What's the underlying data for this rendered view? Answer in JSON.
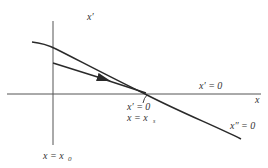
{
  "diagram": {
    "type": "phase-plane trajectory sketch",
    "colors": {
      "background": "#ffffff",
      "stroke": "#2a2a2a",
      "axis": "#555555",
      "text": "#333333"
    },
    "axes": {
      "vertical_label": "x′",
      "horizontal_label": "x"
    },
    "labels": {
      "xprime_zero_axis": "x′ = 0",
      "intersection_line1": "x′ = 0",
      "intersection_line2": "x = x",
      "intersection_sub": "s",
      "xdoubleprime_zero": "x″ = 0",
      "x0_main": "x = x",
      "x0_sub": "0"
    },
    "curves": [
      {
        "name": "x-double-prime-zero-curve",
        "description": "curve x″ = 0 crossing the x-axis at x = x_s"
      },
      {
        "name": "trajectory",
        "description": "trajectory starting on x = x0 moving toward (x_s, 0) with arrow"
      }
    ]
  }
}
